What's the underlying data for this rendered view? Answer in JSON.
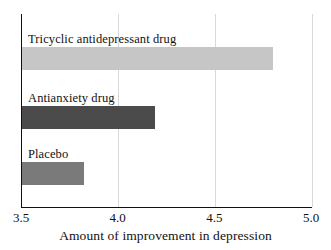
{
  "chart_data": {
    "type": "bar",
    "orientation": "horizontal",
    "title": "",
    "xlabel": "Amount of improvement in depression",
    "ylabel": "",
    "xlim": [
      3.5,
      5.0
    ],
    "xticks": [
      "3.5",
      "4.0",
      "4.5",
      "5.0"
    ],
    "xtick_values": [
      3.5,
      4.0,
      4.5,
      5.0
    ],
    "grid": "vertical-light",
    "legend": "none",
    "categories": [
      "Tricyclic antidepressant drug",
      "Antianxiety drug",
      "Placebo"
    ],
    "values": [
      4.8,
      4.19,
      3.82
    ],
    "bars": [
      {
        "label": "Tricyclic antidepressant drug",
        "value": 4.8,
        "color": "#c6c6c6"
      },
      {
        "label": "Antianxiety drug",
        "value": 4.19,
        "color": "#4b4b4b"
      },
      {
        "label": "Placebo",
        "value": 3.82,
        "color": "#7a7a7a"
      }
    ],
    "colors": {
      "axis": "#111111",
      "gridline": "#d9d9d9",
      "background": "#ffffff",
      "text": "#111111"
    }
  }
}
